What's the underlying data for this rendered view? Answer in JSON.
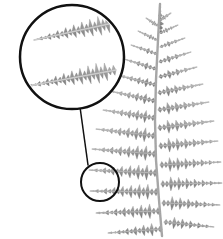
{
  "figure": {
    "background_color": "#ffffff",
    "width": 223,
    "height": 239,
    "cropped_caption_text": "IG",
    "caption_color": "#111111"
  },
  "specimen": {
    "label": "fern-frond",
    "description": "Bipinnate fern frond, grayscale photograph, tip at top, base at bottom right",
    "fill_color": "#8f8f8f",
    "highlight_color": "#bcbcbc",
    "shadow_color": "#6e6e6e",
    "rachis_color": "#a9a9a9",
    "tip_x": 160,
    "tip_y": 4,
    "base_x": 162,
    "base_y": 236,
    "pinna_pair_count": 13
  },
  "callout": {
    "source_circle": {
      "label": "region-of-interest",
      "center_x": 100,
      "center_y": 182,
      "radius": 19,
      "stroke_color": "#111111",
      "stroke_width": 2
    },
    "magnifier_circle": {
      "label": "magnified-detail",
      "center_x": 72,
      "center_y": 57,
      "radius": 52,
      "stroke_color": "#111111",
      "stroke_width": 2.5,
      "fill_color": "#ffffff",
      "contents": "two enlarged pinnules with serrated pinnule segments"
    },
    "leader_line": {
      "label": "connector",
      "x1": 88,
      "y1": 165,
      "x2": 80,
      "y2": 107,
      "stroke_color": "#111111",
      "stroke_width": 1.5
    }
  },
  "chart_data": {
    "type": "scatter",
    "xlabel": "x (px)",
    "ylabel": "y (px)",
    "xlim": [
      0,
      223
    ],
    "ylim": [
      0,
      239
    ],
    "grid": false,
    "legend": "none",
    "rachis": {
      "name": "rachis",
      "points": [
        [
          160,
          4
        ],
        [
          158,
          40
        ],
        [
          156,
          80
        ],
        [
          155,
          120
        ],
        [
          156,
          160
        ],
        [
          159,
          200
        ],
        [
          162,
          236
        ]
      ]
    },
    "series": [
      {
        "name": "left-pinnae",
        "values": [
          {
            "index": 1,
            "base_x": 158,
            "base_y": 26,
            "tip_x": 146,
            "tip_y": 18,
            "length": 14
          },
          {
            "index": 2,
            "base_x": 157,
            "base_y": 40,
            "tip_x": 138,
            "tip_y": 31,
            "length": 21
          },
          {
            "index": 3,
            "base_x": 157,
            "base_y": 54,
            "tip_x": 131,
            "tip_y": 45,
            "length": 28
          },
          {
            "index": 4,
            "base_x": 156,
            "base_y": 69,
            "tip_x": 124,
            "tip_y": 59,
            "length": 34
          },
          {
            "index": 5,
            "base_x": 156,
            "base_y": 85,
            "tip_x": 117,
            "tip_y": 75,
            "length": 40
          },
          {
            "index": 6,
            "base_x": 155,
            "base_y": 101,
            "tip_x": 110,
            "tip_y": 91,
            "length": 46
          },
          {
            "index": 7,
            "base_x": 155,
            "base_y": 118,
            "tip_x": 103,
            "tip_y": 110,
            "length": 53
          },
          {
            "index": 8,
            "base_x": 155,
            "base_y": 136,
            "tip_x": 96,
            "tip_y": 129,
            "length": 59
          },
          {
            "index": 9,
            "base_x": 156,
            "base_y": 154,
            "tip_x": 92,
            "tip_y": 149,
            "length": 64
          },
          {
            "index": 10,
            "base_x": 157,
            "base_y": 173,
            "tip_x": 89,
            "tip_y": 170,
            "length": 68
          },
          {
            "index": 11,
            "base_x": 158,
            "base_y": 192,
            "tip_x": 90,
            "tip_y": 191,
            "length": 68
          },
          {
            "index": 12,
            "base_x": 160,
            "base_y": 211,
            "tip_x": 96,
            "tip_y": 213,
            "length": 64
          },
          {
            "index": 13,
            "base_x": 162,
            "base_y": 229,
            "tip_x": 108,
            "tip_y": 233,
            "length": 54
          }
        ]
      },
      {
        "name": "right-pinnae",
        "values": [
          {
            "index": 1,
            "base_x": 160,
            "base_y": 20,
            "tip_x": 171,
            "tip_y": 13,
            "length": 13
          },
          {
            "index": 2,
            "base_x": 160,
            "base_y": 33,
            "tip_x": 178,
            "tip_y": 25,
            "length": 20
          },
          {
            "index": 3,
            "base_x": 160,
            "base_y": 47,
            "tip_x": 185,
            "tip_y": 38,
            "length": 27
          },
          {
            "index": 4,
            "base_x": 159,
            "base_y": 62,
            "tip_x": 191,
            "tip_y": 52,
            "length": 34
          },
          {
            "index": 5,
            "base_x": 159,
            "base_y": 77,
            "tip_x": 197,
            "tip_y": 67,
            "length": 39
          },
          {
            "index": 6,
            "base_x": 158,
            "base_y": 93,
            "tip_x": 203,
            "tip_y": 84,
            "length": 46
          },
          {
            "index": 7,
            "base_x": 158,
            "base_y": 110,
            "tip_x": 209,
            "tip_y": 102,
            "length": 52
          },
          {
            "index": 8,
            "base_x": 158,
            "base_y": 128,
            "tip_x": 214,
            "tip_y": 121,
            "length": 56
          },
          {
            "index": 9,
            "base_x": 159,
            "base_y": 146,
            "tip_x": 218,
            "tip_y": 141,
            "length": 59
          },
          {
            "index": 10,
            "base_x": 160,
            "base_y": 165,
            "tip_x": 221,
            "tip_y": 162,
            "length": 61
          },
          {
            "index": 11,
            "base_x": 161,
            "base_y": 184,
            "tip_x": 222,
            "tip_y": 183,
            "length": 61
          },
          {
            "index": 12,
            "base_x": 162,
            "base_y": 203,
            "tip_x": 220,
            "tip_y": 205,
            "length": 58
          },
          {
            "index": 13,
            "base_x": 164,
            "base_y": 222,
            "tip_x": 214,
            "tip_y": 227,
            "length": 50
          }
        ]
      }
    ],
    "annotations": [
      {
        "name": "magnifier-circle",
        "cx": 72,
        "cy": 57,
        "r": 52
      },
      {
        "name": "source-circle",
        "cx": 100,
        "cy": 182,
        "r": 19
      },
      {
        "name": "leader-line",
        "x1": 88,
        "y1": 165,
        "x2": 80,
        "y2": 107
      }
    ]
  }
}
